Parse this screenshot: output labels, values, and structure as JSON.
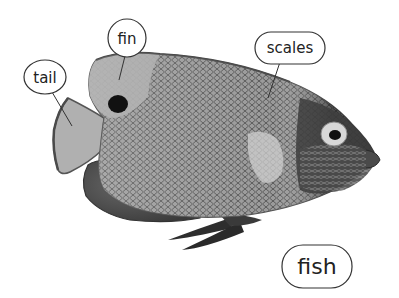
{
  "diagram": {
    "subject": "fish",
    "image_style": "grayscale photograph of an angelfish",
    "colors": {
      "background": "#ffffff",
      "bubble_stroke": "#333333",
      "label_text": "#222222",
      "fish_light": "#b8b8b8",
      "fish_mid": "#8a8a8a",
      "fish_dark": "#3c3c3c"
    },
    "labels": [
      {
        "id": "tail",
        "text": "tail",
        "shape": "ellipse"
      },
      {
        "id": "fin",
        "text": "fin",
        "shape": "circle"
      },
      {
        "id": "scales",
        "text": "scales",
        "shape": "pill"
      },
      {
        "id": "fish",
        "text": "fish",
        "shape": "pill",
        "role": "title"
      }
    ]
  }
}
